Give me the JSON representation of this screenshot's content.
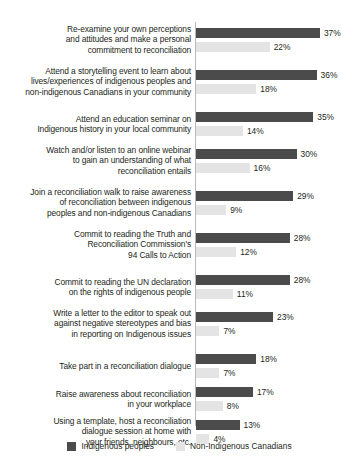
{
  "chart_data": {
    "type": "bar",
    "title": "",
    "subtitle": "",
    "xlabel": "",
    "ylabel": "",
    "orientation": "horizontal",
    "grouped": true,
    "grid": false,
    "legend_position": "bottom-center",
    "xlim": [
      0,
      40
    ],
    "value_suffix": "%",
    "categories": [
      "Re-examine your own perceptions and attitudes and make a personal commitment to reconciliation",
      "Attend a storytelling event to learn about lives/experiences of indigenous peoples and non-indigenous Canadians in your community",
      "Attend an education seminar on Indigenous history in your local community",
      "Watch and/or listen to an online webinar to gain an understanding of what reconciliation entails",
      "Join a reconciliation walk to raise awareness of reconciliation between indigenous peoples and non-indigenous Canadians",
      "Commit to reading the Truth and Reconciliation Commission's 94 Calls to Action",
      "Commit to reading the UN declaration on the rights of indigenous people",
      "Write a letter to the editor to speak out against negative stereotypes and bias in reporting on Indigenous issues",
      "Take part in a reconciliation dialogue",
      "Raise awareness about reconciliation in your workplace",
      "Using a template, host a reconciliation dialogue session at home with your friends, neighbours, etc."
    ],
    "category_lines": [
      [
        "Re-examine your own perceptions",
        "and attitudes and make a personal",
        "commitment to reconciliation"
      ],
      [
        "Attend a storytelling event to learn about",
        "lives/experiences of indigenous peoples and",
        "non-indigenous Canadians in your community"
      ],
      [
        "Attend an education seminar on",
        "Indigenous history in your local community"
      ],
      [
        "Watch and/or listen to an online webinar",
        "to gain an understanding of what",
        "reconciliation entails"
      ],
      [
        "Join a reconciliation walk to raise awareness",
        "of reconciliation between indigenous",
        "peoples and non-indigenous Canadians"
      ],
      [
        "Commit to reading the Truth and",
        "Reconciliation Commission's",
        "94 Calls to Action"
      ],
      [
        "Commit to reading the UN declaration",
        "on the rights of indigenous people"
      ],
      [
        "Write a letter to the editor to speak out",
        "against negative stereotypes and bias",
        "in reporting on Indigenous issues"
      ],
      [
        "Take part in a reconciliation dialogue"
      ],
      [
        "Raise awareness about reconciliation",
        "in your workplace"
      ],
      [
        "Using a template, host a reconciliation",
        "dialogue session at home with",
        "your friends, neighbours, etc."
      ]
    ],
    "series": [
      {
        "name": "Indigenous peoples",
        "color": "#4b4b4b",
        "values": [
          37,
          36,
          35,
          30,
          29,
          28,
          28,
          23,
          18,
          17,
          13
        ],
        "value_labels": [
          "37%",
          "36%",
          "35%",
          "30%",
          "29%",
          "28%",
          "28%",
          "23%",
          "18%",
          "17%",
          "13%"
        ]
      },
      {
        "name": "Non-Indigenous Canadians",
        "color": "#e4e4e4",
        "values": [
          22,
          18,
          14,
          16,
          9,
          12,
          11,
          7,
          7,
          8,
          4
        ],
        "value_labels": [
          "22%",
          "18%",
          "14%",
          "16%",
          "9%",
          "12%",
          "11%",
          "7%",
          "7%",
          "8%",
          "4%"
        ]
      }
    ]
  },
  "legend": {
    "items": [
      {
        "label": "Indigenous peoples",
        "color": "#4b4b4b"
      },
      {
        "label": "Non-Indigenous Canadians",
        "color": "#e4e4e4"
      }
    ]
  }
}
